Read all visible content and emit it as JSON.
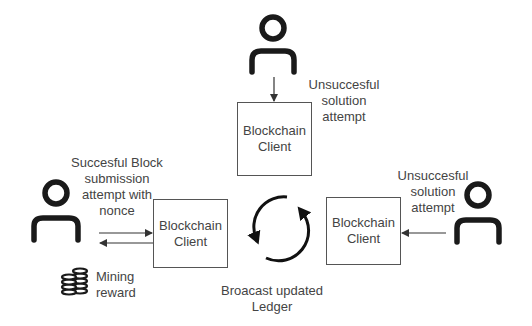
{
  "diagram": {
    "nodes": {
      "client_top": {
        "line1": "Blockchain",
        "line2": "Client"
      },
      "client_left": {
        "line1": "Blockchain",
        "line2": "Client"
      },
      "client_right": {
        "line1": "Blockchain",
        "line2": "Client"
      }
    },
    "actors": [
      {
        "id": "miner_top",
        "icon": "user-icon"
      },
      {
        "id": "miner_left",
        "icon": "user-icon"
      },
      {
        "id": "miner_right",
        "icon": "user-icon"
      }
    ],
    "labels": {
      "top_attempt": {
        "line1": "Unsuccesful",
        "line2": "solution",
        "line3": "attempt"
      },
      "right_attempt": {
        "line1": "Unsuccesful",
        "line2": "solution",
        "line3": "attempt"
      },
      "left_attempt": {
        "line1": "Succesful Block",
        "line2": "submission",
        "line3": "attempt with",
        "line4": "nonce"
      },
      "reward": {
        "line1": "Mining",
        "line2": "reward"
      },
      "broadcast": {
        "line1": "Broacast updated",
        "line2": "Ledger"
      }
    },
    "icons": {
      "reward_icon": "coins-icon",
      "broadcast_icon": "sync-cycle-icon"
    },
    "edges": [
      {
        "from": "miner_top",
        "to": "client_top",
        "label": "top_attempt"
      },
      {
        "from": "miner_right",
        "to": "client_right",
        "label": "right_attempt"
      },
      {
        "from": "miner_left",
        "to": "client_left",
        "label": "left_attempt"
      },
      {
        "from": "client_left",
        "to": "miner_left",
        "label": "reward"
      }
    ],
    "colors": {
      "stroke": "#1a1a1a",
      "box_border": "#555555",
      "text": "#444444"
    }
  }
}
